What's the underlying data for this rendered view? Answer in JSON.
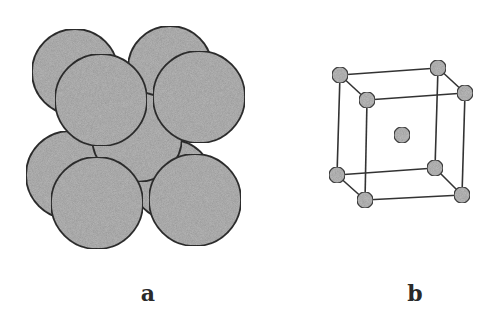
{
  "figure": {
    "panels": [
      {
        "id": "a",
        "label": "a",
        "description": "Space-filling (hard sphere) model of body-centered cubic unit cell",
        "sphere_fill": "#b8b8b8",
        "sphere_stroke": "#333333",
        "spheres": [
          {
            "role": "back-top-left",
            "cx": 75,
            "cy": 72,
            "r": 43
          },
          {
            "role": "back-top-right",
            "cx": 170,
            "cy": 68,
            "r": 42
          },
          {
            "role": "back-bottom-left",
            "cx": 70,
            "cy": 175,
            "r": 44
          },
          {
            "role": "back-bottom-right",
            "cx": 172,
            "cy": 180,
            "r": 40
          },
          {
            "role": "center",
            "cx": 137,
            "cy": 137,
            "r": 45
          },
          {
            "role": "front-top-left",
            "cx": 101,
            "cy": 100,
            "r": 46
          },
          {
            "role": "front-top-right",
            "cx": 199,
            "cy": 97,
            "r": 46
          },
          {
            "role": "front-bottom-left",
            "cx": 97,
            "cy": 203,
            "r": 46
          },
          {
            "role": "front-bottom-right",
            "cx": 195,
            "cy": 200,
            "r": 46
          }
        ]
      },
      {
        "id": "b",
        "label": "b",
        "description": "Reduced-sphere (ball-and-stick) model of body-centered cubic unit cell",
        "node_fill": "#bdbdbd",
        "node_stroke": "#444444",
        "edge_color": "#333333",
        "node_radius": 8,
        "nodes": {
          "btl": [
            340,
            75
          ],
          "btr": [
            438,
            68
          ],
          "bbl": [
            337,
            175
          ],
          "bbr": [
            435,
            168
          ],
          "ftl": [
            367,
            100
          ],
          "ftr": [
            465,
            93
          ],
          "fbl": [
            365,
            200
          ],
          "fbr": [
            462,
            195
          ],
          "center": [
            402,
            135
          ]
        },
        "edges": [
          [
            "btl",
            "btr"
          ],
          [
            "btl",
            "bbl"
          ],
          [
            "btr",
            "bbr"
          ],
          [
            "bbl",
            "bbr"
          ],
          [
            "ftl",
            "ftr"
          ],
          [
            "ftl",
            "fbl"
          ],
          [
            "ftr",
            "fbr"
          ],
          [
            "fbl",
            "fbr"
          ],
          [
            "btl",
            "ftl"
          ],
          [
            "btr",
            "ftr"
          ],
          [
            "bbl",
            "fbl"
          ],
          [
            "bbr",
            "fbr"
          ]
        ]
      }
    ],
    "labels": {
      "a": "a",
      "b": "b"
    }
  }
}
